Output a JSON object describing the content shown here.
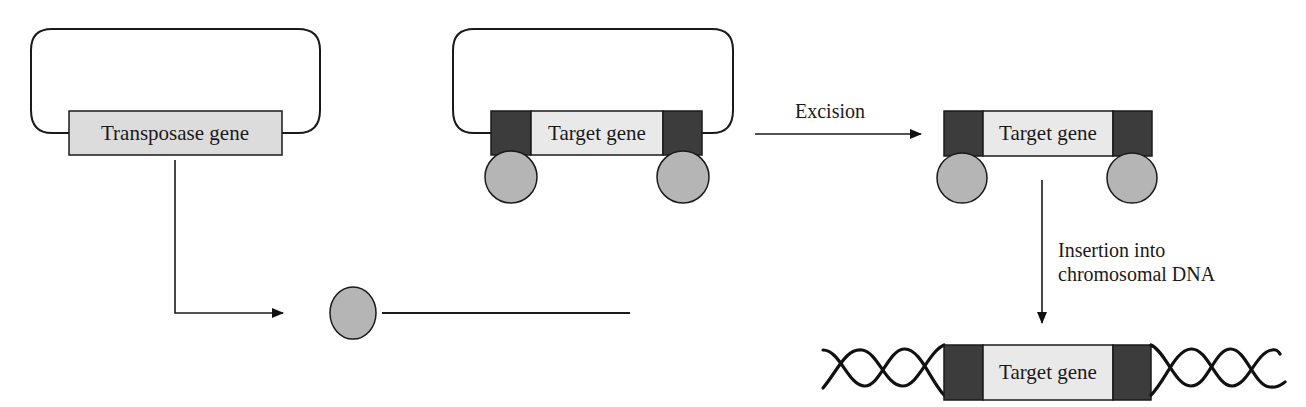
{
  "diagram": {
    "type": "process-flow",
    "colors": {
      "flank": "#3c3c3c",
      "gene_box": "#e9e9e9",
      "transposase_box": "#dcdcdc",
      "protein": "#b5b5b5",
      "line": "#1a1a1a"
    },
    "nodes": {
      "transposase_plasmid": {
        "gene_label": "Transposase gene"
      },
      "target_plasmid": {
        "gene_label": "Target gene"
      },
      "excised_transposon": {
        "gene_label": "Target gene"
      },
      "integrated_chromosome": {
        "gene_label": "Target gene"
      },
      "transposase_protein": {
        "shape": "circle"
      }
    },
    "edges": [
      {
        "from": "transposase_plasmid",
        "to": "transposase_protein",
        "label": ""
      },
      {
        "from": "transposase_protein",
        "to": "target_plasmid",
        "label": ""
      },
      {
        "from": "target_plasmid",
        "to": "excised_transposon",
        "label": "Excision"
      },
      {
        "from": "excised_transposon",
        "to": "integrated_chromosome",
        "label_lines": [
          "Insertion into",
          "chromosomal DNA"
        ]
      }
    ]
  }
}
